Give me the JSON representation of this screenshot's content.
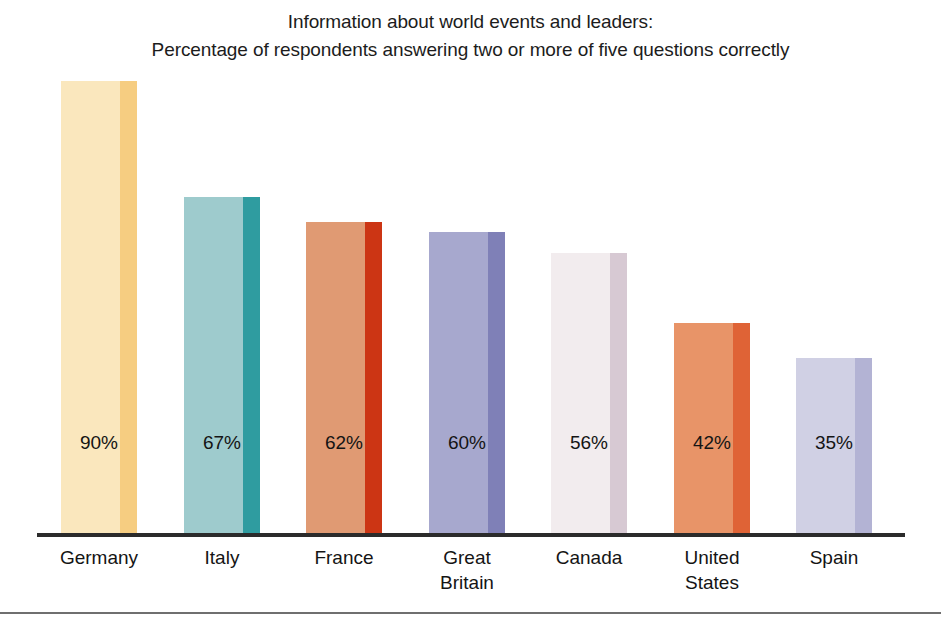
{
  "chart_data": {
    "type": "bar",
    "title": "Information about world events and leaders: Percentage of respondents answering two or more of five questions correctly",
    "title_line1": "Information about world events and leaders:",
    "title_line2": "Percentage of respondents answering two or more of five questions correctly",
    "xlabel": "",
    "ylabel": "",
    "ylim": [
      0,
      100
    ],
    "grid": false,
    "legend": false,
    "categories": [
      "Germany",
      "Italy",
      "France",
      "Great Britain",
      "Canada",
      "United States",
      "Spain"
    ],
    "values": [
      90,
      67,
      62,
      60,
      56,
      42,
      35
    ],
    "value_labels": [
      "90%",
      "67%",
      "62%",
      "60%",
      "56%",
      "42%",
      "35%"
    ],
    "bars": [
      {
        "category": "Germany",
        "category_line1": "Germany",
        "category_line2": "",
        "value": 90,
        "value_label": "90%",
        "body_color": "#fae7bd",
        "edge_color": "#f6cd81"
      },
      {
        "category": "Italy",
        "category_line1": "Italy",
        "category_line2": "",
        "value": 67,
        "value_label": "67%",
        "body_color": "#9ecbcd",
        "edge_color": "#2f9ca0"
      },
      {
        "category": "France",
        "category_line1": "France",
        "category_line2": "",
        "value": 62,
        "value_label": "62%",
        "body_color": "#e09a73",
        "edge_color": "#cc3514"
      },
      {
        "category": "Great Britain",
        "category_line1": "Great",
        "category_line2": "Britain",
        "value": 60,
        "value_label": "60%",
        "body_color": "#a7a8ce",
        "edge_color": "#7f80b7"
      },
      {
        "category": "Canada",
        "category_line1": "Canada",
        "category_line2": "",
        "value": 56,
        "value_label": "56%",
        "body_color": "#f2ecee",
        "edge_color": "#d7c9d3"
      },
      {
        "category": "United States",
        "category_line1": "United",
        "category_line2": "States",
        "value": 42,
        "value_label": "42%",
        "body_color": "#e89468",
        "edge_color": "#df6336"
      },
      {
        "category": "Spain",
        "category_line1": "Spain",
        "category_line2": "",
        "value": 35,
        "value_label": "35%",
        "body_color": "#d0d0e4",
        "edge_color": "#b3b3d4"
      }
    ]
  }
}
